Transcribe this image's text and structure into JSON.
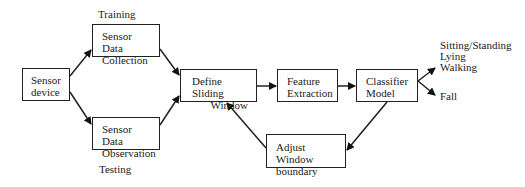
{
  "diagram": {
    "nodes": {
      "sensor_device": {
        "lines": [
          "Sensor",
          "device"
        ]
      },
      "data_collection": {
        "lines": [
          "Sensor Data",
          "Collection"
        ]
      },
      "data_observation": {
        "lines": [
          "Sensor Data",
          "Observation"
        ]
      },
      "sliding_window": {
        "lines": [
          "Define Sliding",
          "Window"
        ]
      },
      "feature_extraction": {
        "lines": [
          "Feature",
          "Extraction"
        ]
      },
      "classifier": {
        "lines": [
          "Classifier",
          "Model"
        ]
      },
      "adjust_window": {
        "lines": [
          "Adjust Window",
          "boundary"
        ]
      }
    },
    "labels": {
      "training": "Training",
      "testing": "Testing",
      "outputs_top": [
        "Sitting/Standing",
        "Lying",
        "Walking"
      ],
      "output_bottom": "Fall"
    },
    "edges": [
      {
        "from": "sensor_device",
        "to": "data_collection"
      },
      {
        "from": "sensor_device",
        "to": "data_observation"
      },
      {
        "from": "data_collection",
        "to": "sliding_window"
      },
      {
        "from": "data_observation",
        "to": "sliding_window"
      },
      {
        "from": "sliding_window",
        "to": "feature_extraction"
      },
      {
        "from": "feature_extraction",
        "to": "classifier"
      },
      {
        "from": "classifier",
        "to": "outputs_top"
      },
      {
        "from": "classifier",
        "to": "output_bottom"
      },
      {
        "from": "classifier",
        "to": "adjust_window"
      },
      {
        "from": "adjust_window",
        "to": "sliding_window"
      }
    ]
  }
}
